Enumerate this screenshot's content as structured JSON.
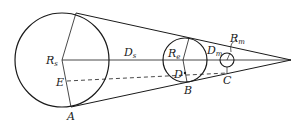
{
  "diagram": {
    "labels": {
      "Rs": {
        "main": "R",
        "sub": "s"
      },
      "Ds": {
        "main": "D",
        "sub": "s"
      },
      "Re": {
        "main": "R",
        "sub": "e"
      },
      "Dm": {
        "main": "D",
        "sub": "m"
      },
      "Rm": {
        "main": "R",
        "sub": "m"
      },
      "E": "E",
      "D": "D",
      "A": "A",
      "B": "B",
      "C": "C"
    },
    "colors": {
      "stroke": "#1a1a1a",
      "background": "#ffffff"
    }
  }
}
